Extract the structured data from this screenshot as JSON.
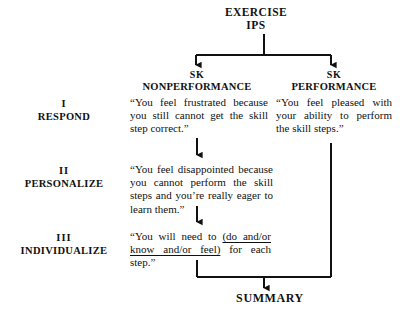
{
  "diagram": {
    "title": {
      "line1": "EXERCISE",
      "line2": "IPS"
    },
    "columns": [
      {
        "id": "nonperformance",
        "sk": "SK",
        "label": "NONPERFORMANCE"
      },
      {
        "id": "performance",
        "sk": "SK",
        "label": "PERFORMANCE"
      }
    ],
    "rows": [
      {
        "numeral": "I",
        "label": "RESPOND"
      },
      {
        "numeral": "II",
        "label": "PERSONALIZE"
      },
      {
        "numeral": "III",
        "label": "INDIVIDUALIZE"
      }
    ],
    "cells": {
      "respond_nonperformance": "“You feel frustrated because you still cannot get the skill step correct.”",
      "respond_performance": "“You feel pleased with your ability to perform the skill steps.”",
      "personalize_nonperformance_pre": "“You feel disappointed because you cannot perform the skill steps and you’re really eager to learn them.”",
      "individualize_pre": "“You will need to ",
      "individualize_underlined": "(do and/or know and/or feel)",
      "individualize_post": " for each step.”"
    },
    "summary": {
      "label": "SUMMARY"
    },
    "colors": {
      "ink": "#111111",
      "background": "#ffffff",
      "connector": "#111111"
    }
  }
}
